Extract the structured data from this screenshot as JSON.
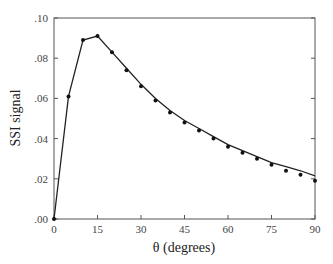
{
  "chart_data": {
    "type": "line",
    "title": "",
    "xlabel": "θ (degrees)",
    "ylabel": "SSI signal",
    "xlim": [
      0,
      90
    ],
    "ylim": [
      0,
      0.1
    ],
    "xticks": [
      0,
      15,
      30,
      45,
      60,
      75,
      90
    ],
    "xtick_labels": [
      "0",
      "15",
      "30",
      "45",
      "60",
      "75",
      "90"
    ],
    "yticks": [
      0,
      0.02,
      0.04,
      0.06,
      0.08,
      0.1
    ],
    "ytick_labels": [
      ".00",
      ".02",
      ".04",
      ".06",
      ".08",
      ".10"
    ],
    "grid": false,
    "legend": null,
    "series": [
      {
        "name": "measured",
        "style": "points",
        "x": [
          0,
          5,
          10,
          15,
          20,
          25,
          30,
          35,
          40,
          45,
          50,
          55,
          60,
          65,
          70,
          75,
          80,
          85,
          90
        ],
        "values": [
          0.0,
          0.061,
          0.089,
          0.091,
          0.083,
          0.074,
          0.066,
          0.059,
          0.053,
          0.048,
          0.044,
          0.04,
          0.036,
          0.033,
          0.03,
          0.027,
          0.024,
          0.022,
          0.019
        ]
      },
      {
        "name": "fit",
        "style": "line",
        "x": [
          0,
          5,
          10,
          15,
          20,
          25,
          30,
          35,
          40,
          45,
          50,
          55,
          60,
          65,
          70,
          75,
          80,
          85,
          90
        ],
        "values": [
          0.0,
          0.061,
          0.089,
          0.091,
          0.083,
          0.075,
          0.067,
          0.06,
          0.054,
          0.049,
          0.045,
          0.041,
          0.037,
          0.034,
          0.031,
          0.028,
          0.026,
          0.024,
          0.0215
        ]
      }
    ]
  }
}
